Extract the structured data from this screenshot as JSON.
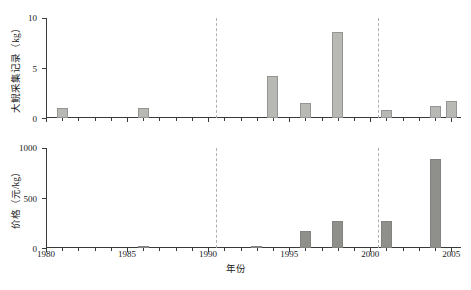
{
  "chart_data": [
    {
      "panel": "top",
      "type": "bar",
      "title": "",
      "xlabel": "年份",
      "ylabel": "大鲵采集记录（kg）",
      "xlim": [
        1980,
        2005.6
      ],
      "ylim": [
        0,
        10
      ],
      "yticks": [
        0,
        5,
        10
      ],
      "ytick_labels": [
        "0",
        "5",
        "10"
      ],
      "xticks": [
        1980,
        1981,
        1982,
        1983,
        1984,
        1985,
        1986,
        1987,
        1988,
        1989,
        1990,
        1991,
        1992,
        1993,
        1994,
        1995,
        1996,
        1997,
        1998,
        1999,
        2000,
        2001,
        2002,
        2003,
        2004,
        2005
      ],
      "xtick_major": [
        1980,
        1985,
        1990,
        1995,
        2000,
        2005
      ],
      "xtick_labels": [
        "1980",
        "1985",
        "1990",
        "1995",
        "2000",
        "2005"
      ],
      "grid": false,
      "legend": "none",
      "bar_color": "#b8b8b4",
      "series": [
        {
          "name": "大鲵采集记录",
          "unit": "kg",
          "x": [
            1981,
            1986,
            1994,
            1996,
            1998,
            2001,
            2004,
            2005
          ],
          "values": [
            1.0,
            1.0,
            4.2,
            1.5,
            8.6,
            0.8,
            1.2,
            1.7
          ]
        }
      ],
      "reference_lines": [
        {
          "x": 1990.5,
          "style": "dashed",
          "color": "#b0b0b0"
        },
        {
          "x": 2000.5,
          "style": "dashed",
          "color": "#b0b0b0"
        }
      ]
    },
    {
      "panel": "bottom",
      "type": "bar",
      "title": "",
      "xlabel": "年份",
      "ylabel": "价格（元/kg）",
      "xlim": [
        1980,
        2005.6
      ],
      "ylim": [
        0,
        1000
      ],
      "yticks": [
        0,
        500,
        1000
      ],
      "ytick_labels": [
        "0",
        "500",
        "1000"
      ],
      "xticks": [
        1980,
        1981,
        1982,
        1983,
        1984,
        1985,
        1986,
        1987,
        1988,
        1989,
        1990,
        1991,
        1992,
        1993,
        1994,
        1995,
        1996,
        1997,
        1998,
        1999,
        2000,
        2001,
        2002,
        2003,
        2004,
        2005
      ],
      "xtick_major": [
        1980,
        1985,
        1990,
        1995,
        2000,
        2005
      ],
      "xtick_labels": [
        "1980",
        "1985",
        "1990",
        "1995",
        "2000",
        "2005"
      ],
      "grid": false,
      "legend": "none",
      "bar_color": "#8f8f8c",
      "series": [
        {
          "name": "价格",
          "unit": "元/kg",
          "x": [
            1986,
            1993,
            1996,
            1998,
            2001,
            2004
          ],
          "values": [
            20,
            25,
            170,
            270,
            275,
            890
          ]
        }
      ],
      "reference_lines": [
        {
          "x": 1990.5,
          "style": "dashed",
          "color": "#b0b0b0"
        },
        {
          "x": 2000.5,
          "style": "dashed",
          "color": "#b0b0b0"
        }
      ]
    }
  ],
  "axes": {
    "x_title": "年份",
    "y_title_top": "大鲵采集记录（kg）",
    "y_title_bottom": "价格（元/kg）"
  }
}
